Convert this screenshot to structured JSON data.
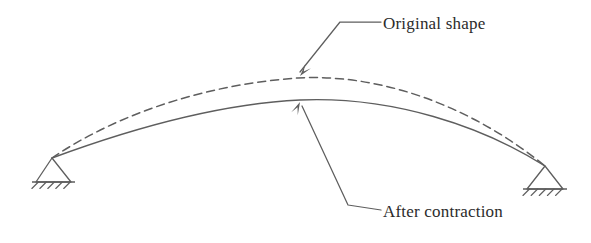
{
  "figure": {
    "background_color": "#ffffff",
    "line_color": "#5e5e5e",
    "text_color": "#2b2b2b"
  },
  "labels": {
    "original": {
      "text": "Original shape",
      "x": 383,
      "y": 29
    },
    "after": {
      "text": "After contraction",
      "x": 383,
      "y": 217
    }
  },
  "curves": {
    "original_shape": {
      "name": "original-shape-curve",
      "style": "dashed",
      "dash_pattern": "8 5",
      "peak_x": 298,
      "peak_y": 78,
      "left_end_x": 52,
      "left_end_y": 158,
      "right_end_x": 545,
      "right_end_y": 166,
      "path": "M 52 158 C 120 112, 210 84, 298 78 C 390 73, 480 113, 545 166"
    },
    "after_contraction": {
      "name": "after-contraction-curve",
      "style": "solid",
      "peak_x": 300,
      "peak_y": 100,
      "left_end_x": 52,
      "left_end_y": 158,
      "right_end_x": 545,
      "right_end_y": 166,
      "path": "M 52 158 C 125 131, 215 104, 300 100 C 392 96, 482 126, 545 166"
    }
  },
  "leaders": {
    "original": {
      "name": "original-shape-leader",
      "path": "M 381 22 L 340 22 L 300 72",
      "arrow_tip_x": 300,
      "arrow_tip_y": 76,
      "arrow_angle": 129
    },
    "after": {
      "name": "after-contraction-leader",
      "path": "M 381 210 L 348 205 L 302 106",
      "arrow_tip_x": 300,
      "arrow_tip_y": 102,
      "arrow_angle": -65
    }
  },
  "supports": {
    "left": {
      "name": "left-pinned-support",
      "apex_x": 52,
      "apex_y": 158,
      "base_y": 182,
      "base_left_x": 36,
      "base_right_x": 71,
      "hatch_count": 5
    },
    "right": {
      "name": "right-pinned-support",
      "apex_x": 545,
      "apex_y": 166,
      "base_y": 189,
      "base_left_x": 527,
      "base_right_x": 563,
      "hatch_count": 5
    }
  }
}
